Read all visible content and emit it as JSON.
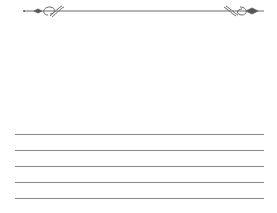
{
  "ornament": {
    "name": "decorative-flourish-divider",
    "color": "#6e6e6e"
  },
  "writing_lines": {
    "count": 5,
    "color": "#8a8a8a",
    "positions_y": [
      134,
      150,
      166,
      182,
      198
    ]
  }
}
